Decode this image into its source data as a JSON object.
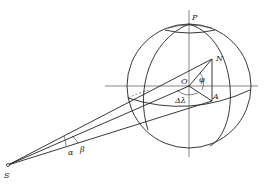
{
  "diagram": {
    "title": "",
    "labels": {
      "pole": "P",
      "point_N": "N",
      "center": "O",
      "point_A": "A",
      "latitude_angle": "φ",
      "longitude_diff": "Δλ",
      "angle_alpha": "α",
      "angle_beta": "β",
      "observer": "S"
    },
    "geometry": {
      "sphere_center": [
        189,
        86
      ],
      "sphere_radius": 62,
      "observer_point": [
        8,
        165
      ],
      "point_N": [
        212,
        59
      ],
      "point_A": [
        212,
        94
      ]
    },
    "colors": {
      "line": "#222222",
      "background": "#ffffff"
    }
  }
}
